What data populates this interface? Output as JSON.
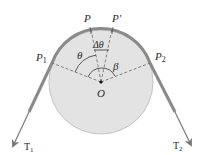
{
  "diagram": {
    "type": "belt-friction-pulley",
    "colors": {
      "drum_fill": "#e3e3e3",
      "drum_stroke": "#bdbdbd",
      "belt": "#8a8a8a",
      "arrow": "#7a7a7a",
      "dashed": "#555555",
      "text": "#2a2a2a"
    },
    "labels": {
      "p": "P",
      "p_prime": "P'",
      "p1_main": "P",
      "p1_sub": "1",
      "p2_main": "P",
      "p2_sub": "2",
      "theta": "θ",
      "delta_theta": "Δθ",
      "beta": "β",
      "origin": "O",
      "t1_main": "T",
      "t1_sub": "1",
      "t2_main": "T",
      "t2_sub": "2"
    }
  }
}
